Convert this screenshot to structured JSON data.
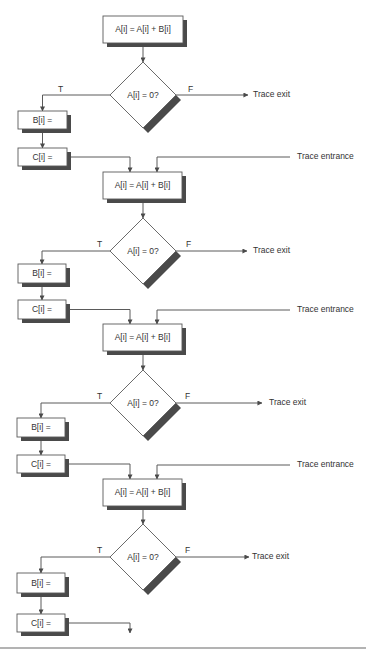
{
  "colors": {
    "line": "#5a5a5a",
    "shadow": "#4a4a4a",
    "box_fill": "#ffffff",
    "text": "#333333",
    "bottom_rule": "#9a9a9a"
  },
  "labels": {
    "assign_a": "A[i] = A[i] + B[i]",
    "test": "A[i] = 0?",
    "assign_b": "B[i] =",
    "assign_c": "C[i] =",
    "true_branch": "T",
    "false_branch": "F",
    "trace_exit": "Trace exit",
    "trace_entrance": "Trace entrance"
  },
  "iterations": [
    {
      "a_box": {
        "x": 103,
        "y": 16,
        "w": 80,
        "h": 27
      },
      "diamond": {
        "cx": 143,
        "cy": 95,
        "r": 33
      },
      "b_box": {
        "x": 18,
        "y": 111,
        "w": 49,
        "h": 18
      },
      "c_box": {
        "x": 18,
        "y": 148,
        "w": 49,
        "h": 18
      },
      "exit_arrow_end": 248,
      "exit_text_x": 253,
      "t_label": {
        "x": 58,
        "y": 90
      },
      "f_label": {
        "x": 188,
        "y": 90
      },
      "entrance": {
        "y": 157,
        "x_end": 290,
        "text_x": 297,
        "drop_x": 157
      }
    },
    {
      "a_box": {
        "x": 103,
        "y": 172,
        "w": 79,
        "h": 27
      },
      "diamond": {
        "cx": 143,
        "cy": 251,
        "r": 33
      },
      "b_box": {
        "x": 18,
        "y": 264,
        "w": 48,
        "h": 19
      },
      "c_box": {
        "x": 18,
        "y": 300,
        "w": 48,
        "h": 19
      },
      "exit_arrow_end": 247,
      "exit_text_x": 253,
      "t_label": {
        "x": 97,
        "y": 245
      },
      "f_label": {
        "x": 186,
        "y": 245
      },
      "entrance": {
        "y": 310,
        "x_end": 290,
        "text_x": 297,
        "drop_x": 157
      }
    },
    {
      "a_box": {
        "x": 103,
        "y": 324,
        "w": 79,
        "h": 27
      },
      "diamond": {
        "cx": 143,
        "cy": 403,
        "r": 33
      },
      "b_box": {
        "x": 17,
        "y": 418,
        "w": 48,
        "h": 19
      },
      "c_box": {
        "x": 17,
        "y": 455,
        "w": 48,
        "h": 18
      },
      "exit_arrow_end": 262,
      "exit_text_x": 269,
      "t_label": {
        "x": 97,
        "y": 397
      },
      "f_label": {
        "x": 185,
        "y": 397
      },
      "entrance": {
        "y": 465,
        "x_end": 290,
        "text_x": 297,
        "drop_x": 157
      }
    },
    {
      "a_box": {
        "x": 103,
        "y": 479,
        "w": 79,
        "h": 27
      },
      "diamond": {
        "cx": 143,
        "cy": 557,
        "r": 33
      },
      "b_box": {
        "x": 17,
        "y": 573,
        "w": 48,
        "h": 20
      },
      "c_box": {
        "x": 17,
        "y": 614,
        "w": 48,
        "h": 18
      },
      "exit_arrow_end": 249,
      "exit_text_x": 252,
      "t_label": {
        "x": 97,
        "y": 551
      },
      "f_label": {
        "x": 185,
        "y": 551
      },
      "entrance": null,
      "tail_arrow": {
        "x": 130,
        "y_end": 633
      }
    }
  ],
  "bottom_rule_y": 648
}
